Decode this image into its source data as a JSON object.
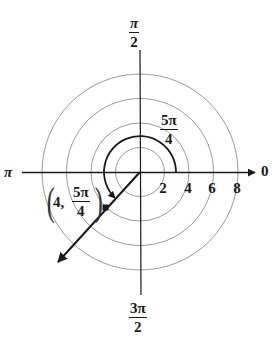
{
  "diagram": {
    "type": "polar-coordinate-plot",
    "center": {
      "x": 140,
      "y": 172
    },
    "unit_px": 12.2,
    "grid_rings": [
      2,
      4,
      6,
      8
    ],
    "axis_labels": {
      "top": {
        "num": "π",
        "den": "2"
      },
      "bottom": {
        "num": "3π",
        "den": "2"
      },
      "left": "π",
      "right": "0"
    },
    "radial_ticks": [
      "2",
      "4",
      "6",
      "8"
    ],
    "angle_arc": {
      "label": {
        "num": "5π",
        "den": "4"
      },
      "from_angle": "0",
      "to_angle": "5π/4",
      "direction": "counterclockwise"
    },
    "point": {
      "r": "4",
      "theta": {
        "num": "5π",
        "den": "4"
      },
      "label_prefix": "4,"
    },
    "colors": {
      "ink": "#1a1a1a",
      "grid": "#9a9a9a",
      "background": "#ffffff"
    }
  }
}
